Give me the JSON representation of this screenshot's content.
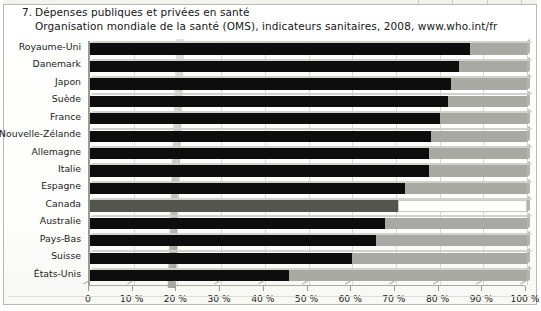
{
  "figure": {
    "number": "7.",
    "title": "Dépenses publiques et privées en santé",
    "source": "Organisation mondiale de la santé (OMS), indicateurs sanitaires, 2008, www.who.int/fr"
  },
  "colors": {
    "public_bar": "#0d0d0d",
    "private_bar": "#a9a9a4",
    "highlight_public_bar": "#55554f",
    "highlight_private_bar": "#fdfdfb",
    "grid": "#d6d6d2",
    "axis": "#9a9a95",
    "text": "#15161a"
  },
  "highlight": {
    "category": "Canada",
    "note": "row drawn in grey / white instead of black / grey"
  },
  "chart_data": {
    "type": "bar",
    "orientation": "horizontal",
    "stacked": true,
    "normalized_to_percent": true,
    "title": "Dépenses publiques et privées en santé",
    "subtitle": "Organisation mondiale de la santé (OMS), indicateurs sanitaires, 2008, www.who.int/fr",
    "xlabel": "",
    "ylabel": "",
    "xlim": [
      0,
      100
    ],
    "grid": true,
    "legend": false,
    "legend_position": "none",
    "xticks": [
      0,
      10,
      20,
      30,
      40,
      50,
      60,
      70,
      80,
      90,
      100
    ],
    "xticklabels": [
      "0",
      "10 %",
      "20 %",
      "30 %",
      "40 %",
      "50 %",
      "60 %",
      "70 %",
      "80 %",
      "90 %",
      "100 %"
    ],
    "categories": [
      "Royaume-Uni",
      "Danemark",
      "Japon",
      "Suède",
      "France",
      "Nouvelle-Zélande",
      "Allemagne",
      "Italie",
      "Espagne",
      "Canada",
      "Australie",
      "Pays-Bas",
      "Suisse",
      "États-Unis"
    ],
    "series": [
      {
        "name": "Dépenses publiques",
        "color": "#0d0d0d",
        "values": [
          87.0,
          84.5,
          82.5,
          82.0,
          80.0,
          78.0,
          77.5,
          77.5,
          72.0,
          70.5,
          67.5,
          65.5,
          60.0,
          45.5
        ]
      },
      {
        "name": "Dépenses privées",
        "color": "#a9a9a4",
        "values": [
          13.0,
          15.5,
          17.5,
          18.0,
          20.0,
          22.0,
          22.5,
          22.5,
          28.0,
          29.5,
          32.5,
          34.5,
          40.0,
          54.5
        ]
      }
    ]
  }
}
